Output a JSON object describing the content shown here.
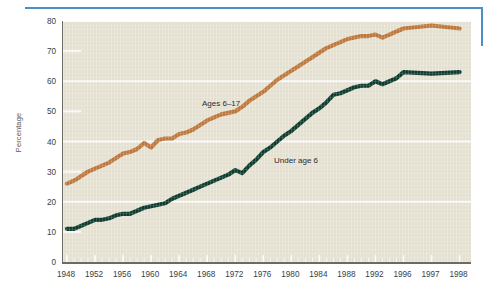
{
  "figure": {
    "decor": {
      "rule_color": "#4a90c4",
      "horizontal_rule_name": "top-blue-rule",
      "vertical_rule_name": "right-blue-rule"
    }
  },
  "chart_data": {
    "type": "line",
    "title": "",
    "subtitle": "",
    "xlabel": "",
    "ylabel": "Percentage",
    "xlim": [
      1948,
      1998
    ],
    "ylim": [
      0,
      80
    ],
    "grid": true,
    "grid_major_values": [
      20,
      40,
      60,
      80
    ],
    "grid_minor_values": [
      10,
      30,
      50,
      70
    ],
    "legend_position": "inline-annotations",
    "background_color": "#e9e5d6",
    "ytick_labels": [
      "0",
      "10",
      "20",
      "30",
      "40",
      "50",
      "60",
      "70",
      "80"
    ],
    "ytick_values": [
      0,
      10,
      20,
      30,
      40,
      50,
      60,
      70,
      80
    ],
    "xtick_labels": [
      "1948",
      "1952",
      "1956",
      "1960",
      "1964",
      "1968",
      "1972",
      "1976",
      "1980",
      "1984",
      "1988",
      "1992",
      "1996",
      "1997",
      "1998"
    ],
    "xtick_values": [
      1948,
      1952,
      1956,
      1960,
      1964,
      1968,
      1972,
      1976,
      1980,
      1984,
      1988,
      1992,
      1996,
      1997,
      1998
    ],
    "x": [
      1948,
      1949,
      1950,
      1951,
      1952,
      1953,
      1954,
      1955,
      1956,
      1957,
      1958,
      1959,
      1960,
      1961,
      1962,
      1963,
      1964,
      1965,
      1966,
      1967,
      1968,
      1969,
      1970,
      1971,
      1972,
      1973,
      1974,
      1975,
      1976,
      1977,
      1978,
      1979,
      1980,
      1981,
      1982,
      1983,
      1984,
      1985,
      1986,
      1987,
      1988,
      1989,
      1990,
      1991,
      1992,
      1993,
      1994,
      1995,
      1996,
      1997,
      1998
    ],
    "series": [
      {
        "name": "Ages 6-17",
        "label": "Ages 6–17",
        "color": "#c07a3e",
        "values": [
          26,
          27,
          28.5,
          30,
          31,
          32,
          33,
          34.5,
          36,
          36.5,
          37.5,
          39.5,
          38,
          40.5,
          41,
          41,
          42.5,
          43,
          44,
          45.5,
          47,
          48,
          49,
          49.5,
          50,
          51.5,
          53.5,
          55,
          56.5,
          58.5,
          60.5,
          62,
          63.5,
          65,
          66.5,
          68,
          69.5,
          71,
          72,
          73,
          74,
          74.5,
          75,
          75,
          75.5,
          74.5,
          75.5,
          76.5,
          77.5,
          78.5,
          77.5
        ]
      },
      {
        "name": "Under age 6",
        "label": "Under age 6",
        "color": "#0d3d30",
        "values": [
          11,
          11,
          12,
          13,
          14,
          14,
          14.5,
          15.5,
          16,
          16,
          17,
          18,
          18.5,
          19,
          19.5,
          21,
          22,
          23,
          24,
          25,
          26,
          27,
          28,
          29,
          30.5,
          29.5,
          32,
          34,
          36.5,
          38,
          40,
          42,
          43.5,
          45.5,
          47.5,
          49.5,
          51,
          53,
          55.5,
          56,
          57,
          58,
          58.5,
          58.5,
          60,
          59,
          60,
          61,
          63,
          62.5,
          63
        ]
      }
    ],
    "annotations": [
      {
        "name": "ages-6-17-label",
        "text": "Ages 6–17",
        "x_px": 202,
        "y_px": 99
      },
      {
        "name": "under-age-6-label",
        "text": "Under age 6",
        "x_px": 274,
        "y_px": 156
      }
    ]
  }
}
